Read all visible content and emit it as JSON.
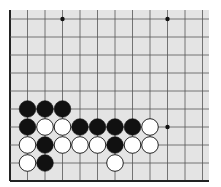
{
  "board": {
    "description": "Go board diagram, lower-left corner region",
    "background": "#e4e4e4",
    "line_color": "#555555",
    "edge_color": "#222222",
    "origin_x": 10,
    "origin_y": 19,
    "col_spacing": 17.5,
    "row_spacing": 18,
    "cols": 12,
    "rows": 10,
    "bg_rect": {
      "x": 10,
      "y": 10,
      "w": 199,
      "h": 171
    },
    "edges": [
      "left",
      "bottom"
    ],
    "star_points": [
      {
        "col": 3,
        "row": 0
      },
      {
        "col": 9,
        "row": 0
      },
      {
        "col": 9,
        "row": 6
      }
    ],
    "stones": [
      {
        "col": 1,
        "row": 5,
        "color": "black"
      },
      {
        "col": 2,
        "row": 5,
        "color": "black"
      },
      {
        "col": 3,
        "row": 5,
        "color": "black"
      },
      {
        "col": 1,
        "row": 6,
        "color": "black"
      },
      {
        "col": 2,
        "row": 6,
        "color": "white"
      },
      {
        "col": 3,
        "row": 6,
        "color": "white"
      },
      {
        "col": 4,
        "row": 6,
        "color": "black"
      },
      {
        "col": 5,
        "row": 6,
        "color": "black"
      },
      {
        "col": 6,
        "row": 6,
        "color": "black"
      },
      {
        "col": 7,
        "row": 6,
        "color": "black"
      },
      {
        "col": 8,
        "row": 6,
        "color": "white"
      },
      {
        "col": 1,
        "row": 7,
        "color": "white"
      },
      {
        "col": 2,
        "row": 7,
        "color": "black"
      },
      {
        "col": 3,
        "row": 7,
        "color": "white"
      },
      {
        "col": 4,
        "row": 7,
        "color": "white"
      },
      {
        "col": 5,
        "row": 7,
        "color": "white"
      },
      {
        "col": 6,
        "row": 7,
        "color": "black"
      },
      {
        "col": 7,
        "row": 7,
        "color": "white"
      },
      {
        "col": 8,
        "row": 7,
        "color": "white"
      },
      {
        "col": 1,
        "row": 8,
        "color": "white"
      },
      {
        "col": 2,
        "row": 8,
        "color": "black"
      },
      {
        "col": 6,
        "row": 8,
        "color": "white"
      }
    ]
  }
}
